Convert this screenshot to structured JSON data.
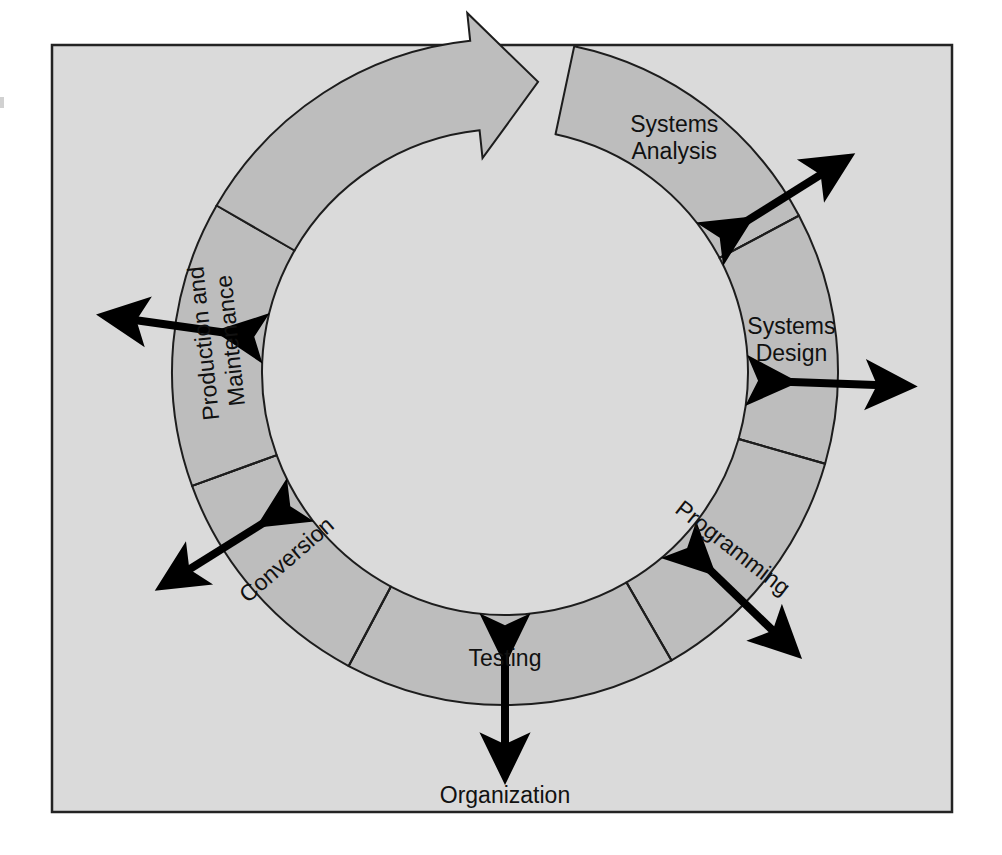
{
  "figure": {
    "frame": {
      "x": 52,
      "y": 45,
      "width": 900,
      "height": 767,
      "fill": "#dadada",
      "stroke": "#232323"
    },
    "ring": {
      "center_x": 505,
      "center_y": 372,
      "outer_radius": 333,
      "inner_radius": 243,
      "fill": "#bdbdbd",
      "stroke": "#1d1d1d",
      "stroke_width": 2
    },
    "arrow_head": {
      "label": "clockwise-flow-arrowhead",
      "fill": "#bdbdbd",
      "stroke": "#1d1d1d"
    },
    "colors": {
      "page_background": "#ffffff",
      "panel_background": "#dadada",
      "band_fill": "#bdbdbd",
      "band_outline": "#1d1d1d",
      "text": "#111111",
      "arrow": "#000000"
    },
    "segments": [
      {
        "id": "systems-analysis",
        "label_line1": "Systems",
        "label_line2": "Analysis",
        "start_angle": -78,
        "end_angle": -28,
        "label_angle": -54,
        "text_rotation": 0,
        "arrow": {
          "type": "double-headed",
          "angle": -32,
          "direction": "outward-diagonal"
        }
      },
      {
        "id": "systems-design",
        "label_line1": "Systems",
        "label_line2": "Design",
        "start_angle": -28,
        "end_angle": 16,
        "label_angle": -6,
        "text_rotation": 0,
        "arrow": {
          "type": "double-headed",
          "angle": 2,
          "direction": "outward-horizontal"
        }
      },
      {
        "id": "programming",
        "label_line1": "Programming",
        "label_line2": "",
        "start_angle": 16,
        "end_angle": 60,
        "label_angle": 38,
        "text_rotation": 38,
        "arrow": {
          "type": "double-headed",
          "angle": 44,
          "direction": "outward-diagonal"
        }
      },
      {
        "id": "testing",
        "label_line1": "Testing",
        "label_line2": "",
        "start_angle": 60,
        "end_angle": 118,
        "label_angle": 90,
        "text_rotation": 0,
        "arrow": {
          "type": "double-headed",
          "angle": 90,
          "direction": "outward-vertical"
        }
      },
      {
        "id": "conversion",
        "label_line1": "Conversion",
        "label_line2": "",
        "start_angle": 118,
        "end_angle": 160,
        "label_angle": 139,
        "text_rotation": -41,
        "arrow": {
          "type": "double-headed",
          "angle": 148,
          "direction": "outward-diagonal"
        }
      },
      {
        "id": "production-and-maintenance",
        "label_line1": "Production and",
        "label_line2": "Maintenance",
        "start_angle": 160,
        "end_angle": 210,
        "label_angle": 186,
        "text_rotation": -96,
        "arrow": {
          "type": "double-headed",
          "angle": 188,
          "direction": "outward-horizontal"
        }
      }
    ],
    "outside_labels": [
      {
        "id": "organization",
        "text": "Organization",
        "x": 505,
        "y": 797
      }
    ]
  }
}
